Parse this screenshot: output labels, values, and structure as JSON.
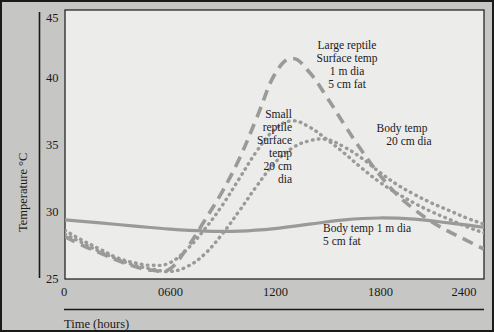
{
  "chart_data": {
    "type": "line",
    "title": "",
    "xlabel": "Time (hours)",
    "ylabel": "Temperature °C",
    "xlim": [
      0,
      2400
    ],
    "ylim": [
      25,
      45
    ],
    "grid": false,
    "legend_position": "inline-annotations",
    "xticks": [
      0,
      600,
      1200,
      1800,
      2400
    ],
    "xticklabels": [
      "0",
      "0600",
      "1200",
      "1800",
      "2400"
    ],
    "yticks": [
      25,
      30,
      35,
      40,
      45
    ],
    "yticklabels": [
      "25",
      "30",
      "35",
      "40",
      "45"
    ],
    "series": [
      {
        "name": "Large reptile Surface temp 1 m dia 5 cm fat",
        "style": "long-dashed",
        "color": "#9a9a98",
        "x": [
          0,
          100,
          200,
          300,
          400,
          500,
          600,
          700,
          800,
          900,
          1000,
          1100,
          1200,
          1300,
          1400,
          1500,
          1600,
          1700,
          1800,
          1900,
          2000,
          2100,
          2200,
          2300,
          2400
        ],
        "y": [
          28.0,
          27.3,
          26.7,
          26.1,
          25.6,
          25.3,
          25.4,
          27.1,
          29.3,
          31.6,
          34.3,
          37.6,
          41.0,
          42.3,
          41.2,
          39.2,
          37.0,
          34.9,
          33.0,
          31.4,
          30.2,
          29.2,
          28.4,
          27.7,
          27.0
        ]
      },
      {
        "name": "Small reptile Surface temp 20 cm dia",
        "style": "dotted",
        "color": "#9a9a98",
        "x": [
          0,
          100,
          200,
          300,
          400,
          500,
          600,
          700,
          800,
          900,
          1000,
          1100,
          1200,
          1300,
          1400,
          1500,
          1600,
          1700,
          1800,
          1900,
          2000,
          2100,
          2200,
          2300,
          2400
        ],
        "y": [
          28.5,
          27.7,
          27.0,
          26.3,
          25.9,
          25.7,
          25.9,
          27.0,
          28.6,
          30.5,
          32.7,
          34.9,
          36.6,
          37.3,
          36.8,
          35.8,
          34.7,
          33.5,
          32.4,
          31.5,
          30.7,
          30.0,
          29.4,
          28.8,
          28.3
        ]
      },
      {
        "name": "Body temp 20 cm dia",
        "style": "dotted",
        "color": "#9a9a98",
        "x": [
          0,
          100,
          200,
          300,
          400,
          500,
          600,
          700,
          800,
          900,
          1000,
          1100,
          1200,
          1300,
          1400,
          1500,
          1600,
          1700,
          1800,
          1900,
          2000,
          2100,
          2200,
          2300,
          2400
        ],
        "y": [
          28.2,
          27.5,
          26.8,
          26.2,
          25.7,
          25.4,
          25.2,
          25.6,
          26.6,
          28.2,
          30.1,
          32.1,
          33.9,
          35.1,
          35.7,
          35.8,
          35.2,
          34.3,
          33.2,
          32.2,
          31.4,
          30.7,
          30.1,
          29.5,
          29.0
        ]
      },
      {
        "name": "Body temp 1 m dia 5 cm fat",
        "style": "solid",
        "color": "#9a9a98",
        "x": [
          0,
          200,
          400,
          600,
          800,
          1000,
          1200,
          1400,
          1600,
          1800,
          2000,
          2200,
          2400
        ],
        "y": [
          29.35,
          29.1,
          28.85,
          28.6,
          28.45,
          28.45,
          28.65,
          29.0,
          29.35,
          29.5,
          29.4,
          29.1,
          28.75
        ]
      }
    ],
    "annotations": [
      {
        "id": "large-reptile",
        "lines": [
          "Large reptile",
          "Surface temp",
          "1 m dia",
          "5 cm fat"
        ],
        "align": "center"
      },
      {
        "id": "small-reptile",
        "lines": [
          "Small",
          "reptile",
          "Surface",
          "temp",
          "20 cm",
          "dia"
        ],
        "align": "right"
      },
      {
        "id": "body-temp-20cm",
        "lines": [
          "Body temp",
          "20 cm dia"
        ],
        "align": "center"
      },
      {
        "id": "body-temp-1m",
        "lines": [
          "Body temp 1 m dia",
          "5 cm fat"
        ],
        "align": "left"
      }
    ]
  }
}
